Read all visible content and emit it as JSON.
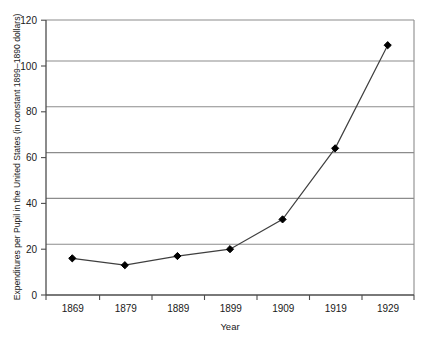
{
  "chart_data": {
    "type": "line",
    "title": "",
    "xlabel": "Year",
    "ylabel": "Expenditures per Pupil in the United States  (in constant 1899–1890 dollars)",
    "categories": [
      "1869",
      "1879",
      "1889",
      "1899",
      "1909",
      "1919",
      "1929"
    ],
    "x": [
      1869,
      1879,
      1889,
      1899,
      1909,
      1919,
      1929
    ],
    "values": [
      16,
      13,
      17,
      20,
      33,
      64,
      109
    ],
    "series": [
      {
        "name": "Expenditures per Pupil",
        "values": [
          16,
          13,
          17,
          20,
          33,
          64,
          109
        ]
      }
    ],
    "ylim": [
      0,
      120
    ],
    "ytick_labels": [
      "0",
      "20",
      "40",
      "60",
      "80",
      "100",
      "120"
    ],
    "yticks": [
      0,
      20,
      40,
      60,
      80,
      100,
      120
    ],
    "grid": "horizontal",
    "legend": "none",
    "marker": "diamond",
    "line_color": "#3f3f3f",
    "marker_color": "#000000",
    "grid_color": "#8c8c8c",
    "axis_color": "#6e6e6e"
  },
  "axes": {
    "y_title": "Expenditures per Pupil in the United States  (in constant 1899–1890 dollars)",
    "x_title": "Year"
  },
  "y_labels": {
    "t0": "0",
    "t1": "20",
    "t2": "40",
    "t3": "60",
    "t4": "80",
    "t5": "100",
    "t6": "120"
  },
  "x_labels": {
    "t0": "1869",
    "t1": "1879",
    "t2": "1889",
    "t3": "1899",
    "t4": "1909",
    "t5": "1919",
    "t6": "1929"
  }
}
